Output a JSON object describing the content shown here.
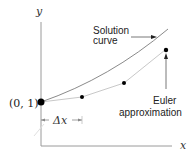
{
  "axes": {
    "x_label": "x",
    "y_label": "y"
  },
  "initial_point": {
    "label": "(0, 1)"
  },
  "step": {
    "label": "Δx"
  },
  "annotations": {
    "solution_line1": "Solution",
    "solution_line2": "curve",
    "euler_line1": "Euler",
    "euler_line2": "approximation"
  },
  "colors": {
    "axis": "#9a9a9a",
    "solution_curve": "#8a8a8a",
    "euler_line": "#c8c8c8",
    "point": "#000000",
    "text": "#222222"
  }
}
